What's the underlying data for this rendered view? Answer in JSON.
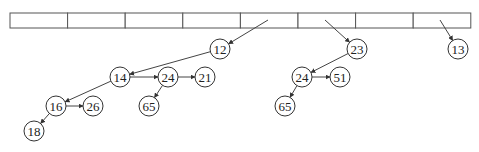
{
  "diagram": {
    "title": "",
    "array": {
      "cell_count": 8,
      "x": 10,
      "y": 13,
      "cell_width": 57.6,
      "height": 15
    },
    "nodes": [
      {
        "id": "n12",
        "label": "12",
        "x": 220,
        "y": 49
      },
      {
        "id": "n23",
        "label": "23",
        "x": 357,
        "y": 49
      },
      {
        "id": "n13",
        "label": "13",
        "x": 458,
        "y": 49
      },
      {
        "id": "n14",
        "label": "14",
        "x": 120,
        "y": 77
      },
      {
        "id": "n24a",
        "label": "24",
        "x": 168,
        "y": 77
      },
      {
        "id": "n21",
        "label": "21",
        "x": 205,
        "y": 77
      },
      {
        "id": "n24b",
        "label": "24",
        "x": 302,
        "y": 77
      },
      {
        "id": "n51",
        "label": "51",
        "x": 340,
        "y": 77
      },
      {
        "id": "n16",
        "label": "16",
        "x": 56,
        "y": 106
      },
      {
        "id": "n26",
        "label": "26",
        "x": 93,
        "y": 106
      },
      {
        "id": "n65a",
        "label": "65",
        "x": 149,
        "y": 106
      },
      {
        "id": "n65b",
        "label": "65",
        "x": 285,
        "y": 106
      },
      {
        "id": "n18",
        "label": "18",
        "x": 34,
        "y": 131
      }
    ],
    "edges": [
      {
        "from_xy": [
          268,
          20
        ],
        "to": "n12"
      },
      {
        "from_xy": [
          325,
          20
        ],
        "to": "n23"
      },
      {
        "from_xy": [
          440,
          20
        ],
        "to": "n13"
      },
      {
        "from": "n12",
        "to": "n14"
      },
      {
        "from": "n14",
        "to": "n24a"
      },
      {
        "from": "n24a",
        "to": "n21"
      },
      {
        "from": "n24a",
        "to": "n65a"
      },
      {
        "from": "n14",
        "to": "n16"
      },
      {
        "from": "n16",
        "to": "n26"
      },
      {
        "from": "n16",
        "to": "n18"
      },
      {
        "from": "n23",
        "to": "n24b"
      },
      {
        "from": "n24b",
        "to": "n51"
      },
      {
        "from": "n24b",
        "to": "n65b"
      }
    ]
  }
}
